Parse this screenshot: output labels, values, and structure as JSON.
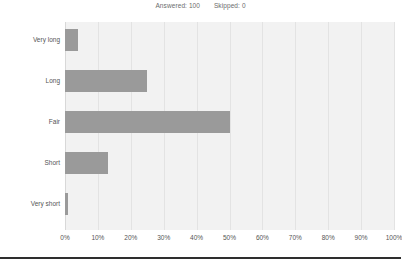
{
  "header": {
    "answered_label": "Answered: 100",
    "skipped_label": "Skipped: 0"
  },
  "colors": {
    "bar": "#9a9a9a",
    "plot_background": "#f2f2f2",
    "gridline": "#e3e3e3",
    "text": "#555555",
    "rule": "#2e2e2e"
  },
  "chart_data": {
    "type": "bar",
    "orientation": "horizontal",
    "title": "",
    "xlabel": "",
    "ylabel": "",
    "categories": [
      "Very long",
      "Long",
      "Fair",
      "Short",
      "Very short"
    ],
    "values": [
      4,
      25,
      50,
      13,
      1
    ],
    "value_unit": "%",
    "xlim": [
      0,
      100
    ],
    "xticks": [
      0,
      10,
      20,
      30,
      40,
      50,
      60,
      70,
      80,
      90,
      100
    ],
    "xtick_labels": [
      "0%",
      "10%",
      "20%",
      "30%",
      "40%",
      "50%",
      "60%",
      "70%",
      "80%",
      "90%",
      "100%"
    ],
    "grid": true,
    "legend": false,
    "series": [
      {
        "name": "Responses",
        "values": [
          4,
          25,
          50,
          13,
          1
        ]
      }
    ]
  }
}
